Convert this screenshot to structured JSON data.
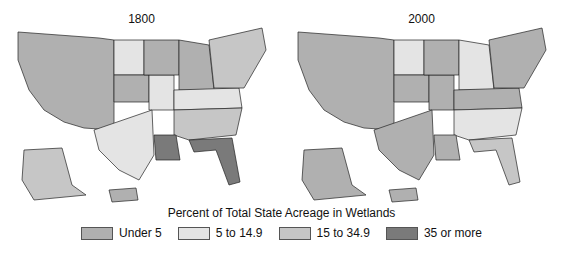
{
  "note": "State outlines are a simplified schematic, not real geographic boundaries; per-state category assignments are an approximate reading of the screenshot.",
  "legend": {
    "title": "Percent of Total State Acreage in Wetlands",
    "items": [
      {
        "label": "Under 5",
        "color": "#b0b0b0"
      },
      {
        "label": "5 to 14.9",
        "color": "#e4e4e4"
      },
      {
        "label": "15 to 34.9",
        "color": "#c6c6c6"
      },
      {
        "label": "35 or more",
        "color": "#7a7a7a"
      }
    ]
  },
  "maps": [
    {
      "year": "1800",
      "fills": {
        "west": "#b0b0b0",
        "plains_north": "#e4e4e4",
        "plains_south": "#e4e4e4",
        "kansas": "#b0b0b0",
        "midwest": "#b0b0b0",
        "great_lakes": "#b0b0b0",
        "southeast": "#c6c6c6",
        "appalachia": "#e4e4e4",
        "northeast": "#c6c6c6",
        "louisiana": "#7a7a7a",
        "florida": "#7a7a7a",
        "texas": "#e4e4e4",
        "alaska": "#c6c6c6",
        "hawaii": "#b0b0b0"
      }
    },
    {
      "year": "2000",
      "fills": {
        "west": "#b0b0b0",
        "plains_north": "#e4e4e4",
        "plains_south": "#b0b0b0",
        "kansas": "#b0b0b0",
        "midwest": "#b0b0b0",
        "great_lakes": "#e4e4e4",
        "southeast": "#e4e4e4",
        "appalachia": "#b0b0b0",
        "northeast": "#b0b0b0",
        "louisiana": "#b0b0b0",
        "florida": "#c6c6c6",
        "texas": "#b0b0b0",
        "alaska": "#b0b0b0",
        "hawaii": "#b0b0b0"
      }
    }
  ]
}
